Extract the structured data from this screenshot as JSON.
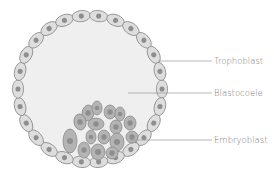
{
  "diagram": {
    "colors": {
      "background": "#ffffff",
      "cavity_fill": "#efefef",
      "trophoblast_cell_fill": "#dedede",
      "trophoblast_cell_stroke": "#8a8a8a",
      "embryoblast_cell_fill": "#b4b4b4",
      "embryoblast_cell_stroke": "#8a8a8a",
      "nucleus_fill": "#8e8e8e",
      "leader_line": "#9a9a9a",
      "label_text": "#7a7a7a"
    },
    "labels": [
      {
        "id": "trophoblast",
        "text": "Trophoblast",
        "line_from": [
          158,
          61
        ],
        "line_to": [
          212,
          61
        ]
      },
      {
        "id": "blastocoele",
        "text": "Blastocoele",
        "line_from": [
          128,
          93
        ],
        "line_to": [
          212,
          93
        ]
      },
      {
        "id": "embryoblast",
        "text": "Embryoblast",
        "line_from": [
          130,
          140
        ],
        "line_to": [
          212,
          140
        ]
      }
    ]
  }
}
